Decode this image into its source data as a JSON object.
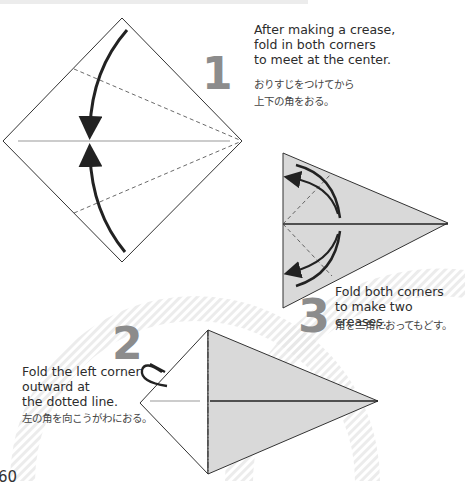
{
  "page": {
    "number": "60"
  },
  "steps": [
    {
      "number": "1",
      "text_lines": [
        "After making a crease,",
        "fold in both corners",
        "to meet at the center."
      ],
      "jp_lines": [
        "おりすじをつけてから",
        "上下の角をおる。"
      ]
    },
    {
      "number": "2",
      "text_lines": [
        "Fold the left corner",
        "outward at",
        "the dotted line."
      ],
      "jp_lines": [
        "左の角を向こうがわにおる。"
      ]
    },
    {
      "number": "3",
      "text_lines": [
        "Fold both corners",
        "to make two creases."
      ],
      "jp_lines": [
        "角を三角におってもどす。"
      ]
    }
  ],
  "colors": {
    "paper_fill": "#d9d9d9",
    "line": "#333333",
    "step_number": "#8c8c8c",
    "sunburst": "#ebebeb"
  }
}
